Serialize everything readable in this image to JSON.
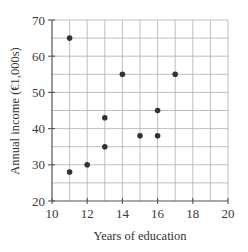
{
  "chart_data": {
    "type": "scatter",
    "title": "",
    "xlabel": "Years of education",
    "ylabel": "Annual income (€1,000s)",
    "xlim": [
      10,
      20
    ],
    "ylim": [
      20,
      70
    ],
    "x_ticks": [
      10,
      12,
      14,
      16,
      18,
      20
    ],
    "y_ticks": [
      20,
      30,
      40,
      50,
      60,
      70
    ],
    "x_tick_labels": [
      "10",
      "12",
      "14",
      "16",
      "18",
      "20"
    ],
    "y_tick_labels": [
      "20",
      "30",
      "40",
      "50",
      "60",
      "70"
    ],
    "grid": true,
    "grid_x_step": 1,
    "grid_y_step": 5,
    "legend": null,
    "series": [
      {
        "name": "observations",
        "points": [
          {
            "x": 11,
            "y": 65
          },
          {
            "x": 14,
            "y": 55
          },
          {
            "x": 17,
            "y": 55
          },
          {
            "x": 13,
            "y": 43
          },
          {
            "x": 16,
            "y": 45
          },
          {
            "x": 15,
            "y": 38
          },
          {
            "x": 16,
            "y": 38
          },
          {
            "x": 13,
            "y": 35
          },
          {
            "x": 12,
            "y": 30
          },
          {
            "x": 11,
            "y": 28
          }
        ]
      }
    ],
    "colors": {
      "point": "#333333",
      "grid": "#b8b8b8",
      "axis": "#555555",
      "text": "#333333"
    }
  }
}
